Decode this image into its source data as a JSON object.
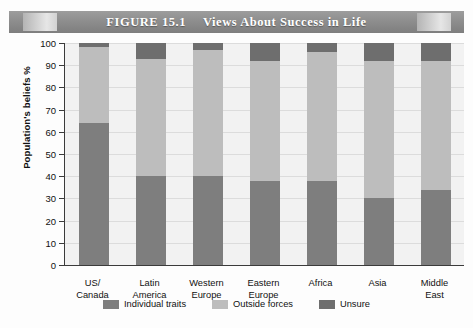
{
  "figure": {
    "number_label": "FIGURE 15.1",
    "title": "Views About Success in Life"
  },
  "colors": {
    "individual_traits": "#7e7e7e",
    "outside_forces": "#bdbdbd",
    "unsure": "#6e6e6e",
    "plot_background": "#f2f2f2",
    "axis": "#3b3b3b",
    "gridline": "#dcdcdc",
    "banner": "#8e8e8e",
    "banner_text": "#ffffff"
  },
  "chart_data": {
    "type": "bar",
    "stacked": true,
    "xlabel": "",
    "ylabel": "Population's beliefs %",
    "ylim": [
      0,
      100
    ],
    "yticks": [
      0,
      10,
      20,
      30,
      40,
      50,
      60,
      70,
      80,
      90,
      100
    ],
    "ytick_labels": [
      "0",
      "10",
      "20",
      "30",
      "40",
      "50",
      "60",
      "70",
      "80",
      "90",
      "100"
    ],
    "grid": true,
    "legend_position": "bottom",
    "categories": [
      "US/ Canada",
      "Latin America",
      "Western Europe",
      "Eastern Europe",
      "Africa",
      "Asia",
      "Middle East"
    ],
    "category_lines": [
      [
        "US/",
        "Canada"
      ],
      [
        "Latin",
        "America"
      ],
      [
        "Western",
        "Europe"
      ],
      [
        "Eastern",
        "Europe"
      ],
      [
        "Africa",
        ""
      ],
      [
        "Asia",
        ""
      ],
      [
        "Middle",
        "East"
      ]
    ],
    "series": [
      {
        "name": "Individual traits",
        "color": "#7e7e7e",
        "values": [
          64,
          40,
          40,
          38,
          38,
          30,
          34
        ]
      },
      {
        "name": "Outside forces",
        "color": "#bdbdbd",
        "values": [
          34,
          53,
          57,
          54,
          58,
          62,
          58
        ]
      },
      {
        "name": "Unsure",
        "color": "#6e6e6e",
        "values": [
          2,
          7,
          3,
          8,
          4,
          8,
          8
        ]
      }
    ]
  },
  "legend": {
    "items": [
      {
        "label": "Individual traits",
        "color": "#7e7e7e"
      },
      {
        "label": "Outside forces",
        "color": "#bdbdbd"
      },
      {
        "label": "Unsure",
        "color": "#6e6e6e"
      }
    ]
  }
}
